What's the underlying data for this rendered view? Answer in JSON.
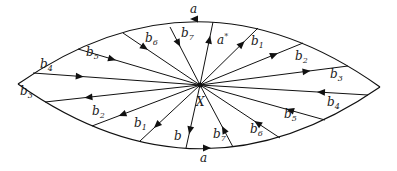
{
  "diagram": {
    "center_label": "X",
    "boundary": {
      "top_label": "a",
      "bottom_label": "a",
      "left_corner": [
        18,
        84
      ],
      "right_corner": [
        380,
        87
      ],
      "top_control": [
        199,
        -42
      ],
      "bottom_control": [
        199,
        212
      ]
    },
    "center": [
      200,
      85
    ],
    "spokes": [
      {
        "id": "b4-left",
        "label": "b",
        "sub": "4",
        "end": [
          33,
          73
        ],
        "arrow": "in",
        "lx": 40,
        "ly": 68
      },
      {
        "id": "b5-left",
        "label": "b",
        "sub": "5",
        "end": [
          78,
          49
        ],
        "arrow": "in",
        "lx": 86,
        "ly": 56
      },
      {
        "id": "b6-left",
        "label": "b",
        "sub": "6",
        "end": [
          123,
          33
        ],
        "arrow": "in",
        "lx": 145,
        "ly": 42
      },
      {
        "id": "b7-left",
        "label": "b",
        "sub": "7",
        "end": [
          170,
          27
        ],
        "arrow": "in",
        "lx": 181,
        "ly": 37
      },
      {
        "id": "a-star",
        "label": "a*",
        "sub": "",
        "end": [
          213,
          22
        ],
        "arrow": "out",
        "lx": 217,
        "ly": 44
      },
      {
        "id": "b1-right",
        "label": "b",
        "sub": "1",
        "end": [
          258,
          28
        ],
        "arrow": "out",
        "lx": 251,
        "ly": 45
      },
      {
        "id": "b2-right",
        "label": "b",
        "sub": "2",
        "end": [
          303,
          43
        ],
        "arrow": "out",
        "lx": 295,
        "ly": 60
      },
      {
        "id": "b3-right",
        "label": "b",
        "sub": "3",
        "end": [
          348,
          66
        ],
        "arrow": "out",
        "lx": 330,
        "ly": 78
      },
      {
        "id": "b3-left",
        "label": "b",
        "sub": "3",
        "end": [
          45,
          102
        ],
        "arrow": "out",
        "lx": 20,
        "ly": 95
      },
      {
        "id": "b2-left",
        "label": "b",
        "sub": "2",
        "end": [
          92,
          126
        ],
        "arrow": "out",
        "lx": 92,
        "ly": 115
      },
      {
        "id": "b1-left",
        "label": "b",
        "sub": "1",
        "end": [
          140,
          141
        ],
        "arrow": "out",
        "lx": 134,
        "ly": 127
      },
      {
        "id": "b-bottom",
        "label": "b",
        "sub": "",
        "end": [
          186,
          148
        ],
        "arrow": "out",
        "lx": 174,
        "ly": 140
      },
      {
        "id": "b7-right",
        "label": "b",
        "sub": "7",
        "end": [
          233,
          147
        ],
        "arrow": "in",
        "lx": 213,
        "ly": 138
      },
      {
        "id": "b6-right",
        "label": "b",
        "sub": "6",
        "end": [
          280,
          138
        ],
        "arrow": "in",
        "lx": 250,
        "ly": 133
      },
      {
        "id": "b5-right",
        "label": "b",
        "sub": "5",
        "end": [
          325,
          120
        ],
        "arrow": "in",
        "lx": 284,
        "ly": 118
      },
      {
        "id": "b4-right",
        "label": "b",
        "sub": "4",
        "end": [
          368,
          95
        ],
        "arrow": "in",
        "lx": 327,
        "ly": 106
      }
    ],
    "top_a_label": {
      "text": "a",
      "x": 190,
      "y": 13
    },
    "bottom_a_label": {
      "text": "a",
      "x": 200,
      "y": 162
    },
    "x_label": {
      "text": "X",
      "x": 196,
      "y": 106
    }
  }
}
